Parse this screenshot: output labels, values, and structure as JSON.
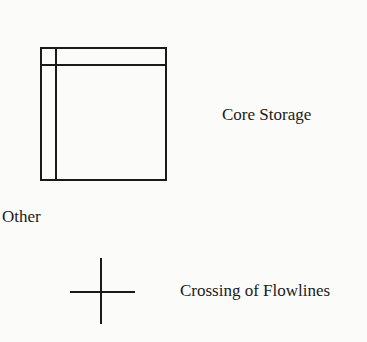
{
  "symbols": [
    {
      "id": "core-storage",
      "label": "Core Storage",
      "shape": "square-with-inner-corner-lines"
    },
    {
      "id": "crossing-of-flowlines",
      "label": "Crossing of Flowlines",
      "shape": "cross"
    }
  ],
  "section_heading": "Other",
  "colors": {
    "stroke": "#1a1a1a",
    "background": "#fbfbfa"
  }
}
